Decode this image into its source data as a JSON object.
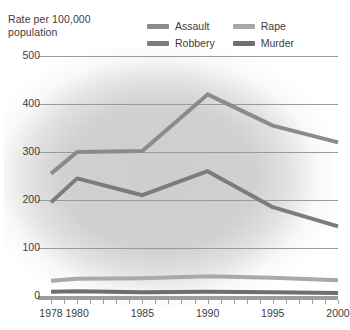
{
  "chart_data": {
    "type": "line",
    "title": "Rate per 100,000 population",
    "xlabel": "",
    "ylabel": "Rate per 100,000 population",
    "x": [
      1978,
      1980,
      1985,
      1990,
      1995,
      2000
    ],
    "xtick_labels": [
      "1978",
      "1980",
      "1985",
      "1990",
      "1995",
      "2000"
    ],
    "ytick_labels": [
      "0",
      "100",
      "200",
      "300",
      "400",
      "500"
    ],
    "yticks": [
      0,
      100,
      200,
      300,
      400,
      500
    ],
    "ylim": [
      0,
      500
    ],
    "xlim": [
      1977,
      2000
    ],
    "grid": "horizontal",
    "legend_position": "top-center",
    "series": [
      {
        "name": "Assault",
        "color": "#8b8b8b",
        "values": [
          255,
          300,
          302,
          420,
          355,
          320
        ]
      },
      {
        "name": "Robbery",
        "color": "#7c7c7c",
        "values": [
          195,
          245,
          210,
          260,
          185,
          145
        ]
      },
      {
        "name": "Rape",
        "color": "#a9a9a9",
        "values": [
          32,
          36,
          37,
          41,
          38,
          33
        ]
      },
      {
        "name": "Murder",
        "color": "#6e6e6e",
        "values": [
          9,
          10,
          8,
          9,
          8,
          6
        ]
      }
    ]
  },
  "legend": {
    "entries": [
      {
        "label": "Assault",
        "color": "#8b8b8b"
      },
      {
        "label": "Rape",
        "color": "#a9a9a9"
      },
      {
        "label": "Robbery",
        "color": "#7c7c7c"
      },
      {
        "label": "Murder",
        "color": "#6e6e6e"
      }
    ]
  },
  "axis": {
    "y_title": "Rate per 100,000\npopulation"
  },
  "colors": {
    "gridline": "#9a9a9a",
    "axis": "#9d9d9d",
    "text": "#3c3c3c",
    "background": "#ffffff",
    "plot_glow": "#b0b0b0"
  }
}
